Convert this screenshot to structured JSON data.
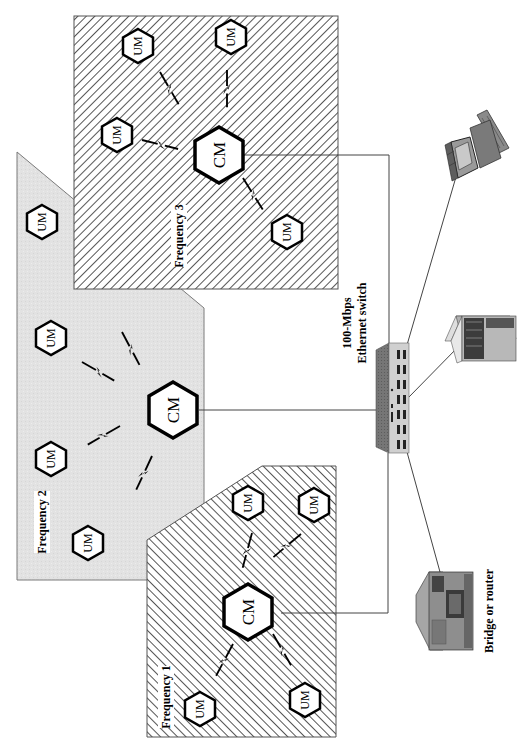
{
  "diagram": {
    "type": "network-topology",
    "orientation": "rotated-90-ccw"
  },
  "colors": {
    "line": "#3a3a3a",
    "hatch": "#2a2a2a",
    "zone_fill_gray": "#e3e3e3",
    "hex_stroke": "#000000",
    "hex_fill": "#ffffff",
    "switch_face": "#cfcfcf",
    "switch_side": "#6e6e6e"
  },
  "zones": [
    {
      "id": "frequency-1",
      "label": "Frequency 1",
      "fill": "hatch",
      "central_module": "CM",
      "user_modules": [
        "UM",
        "UM",
        "UM",
        "UM"
      ]
    },
    {
      "id": "frequency-2",
      "label": "Frequency 2",
      "fill": "gray",
      "central_module": "CM",
      "user_modules": [
        "UM",
        "UM",
        "UM",
        "UM"
      ]
    },
    {
      "id": "frequency-3",
      "label": "Frequency 3",
      "fill": "hatch",
      "central_module": "CM",
      "user_modules": [
        "UM",
        "UM",
        "UM",
        "UM"
      ]
    }
  ],
  "nodes": {
    "cm_label": "CM",
    "um_label": "UM"
  },
  "switch": {
    "label_line1": "100-Mbps",
    "label_line2": "Ethernet switch"
  },
  "devices": [
    {
      "id": "workstation",
      "label": ""
    },
    {
      "id": "server",
      "label": ""
    },
    {
      "id": "bridge-router",
      "label": "Bridge or router"
    }
  ]
}
